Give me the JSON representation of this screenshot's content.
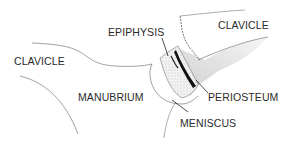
{
  "diagram": {
    "labels": {
      "epiphysis": "EPIPHYSIS",
      "clavicle_right": "CLAVICLE",
      "clavicle_left": "CLAVICLE",
      "manubrium": "MANUBRIUM",
      "periosteum": "PERIOSTEUM",
      "meniscus": "MENISCUS"
    },
    "colors": {
      "outline": "#7a7a7a",
      "text": "#2a2a2a",
      "periosteum_band": "#111111",
      "shading": "#d8d8d8",
      "stipple": "#e8e8e8"
    }
  }
}
